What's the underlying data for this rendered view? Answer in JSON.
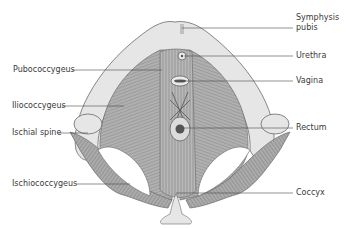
{
  "figure": {
    "labels_left": [
      {
        "id": "pubococcygeus",
        "text": "Pubococcygeus"
      },
      {
        "id": "iliococcygeus",
        "text": "Iliococcygeus"
      },
      {
        "id": "ischial-spine",
        "text": "Ischial spine"
      },
      {
        "id": "ischiococcygeus",
        "text": "Ischiococcygeus"
      }
    ],
    "labels_right": [
      {
        "id": "symphysis-pubis",
        "text": "Symphysis\npubis",
        "line1": "Symphysis",
        "line2": "pubis"
      },
      {
        "id": "urethra",
        "text": "Urethra"
      },
      {
        "id": "vagina",
        "text": "Vagina"
      },
      {
        "id": "rectum",
        "text": "Rectum"
      },
      {
        "id": "coccyx",
        "text": "Coccyx"
      }
    ]
  },
  "colors": {
    "bone": "#e4e4e4",
    "bone_outline": "#6a6a6a",
    "muscle": "#a8a8a8",
    "muscle_dark": "#7a7a7a",
    "leader_line": "#4a4a4a",
    "text": "#3a3a3a"
  }
}
